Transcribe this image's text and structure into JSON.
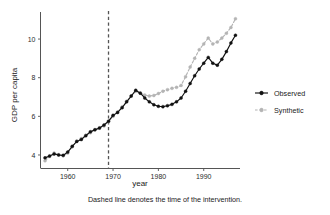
{
  "chart_data": {
    "type": "line",
    "title": "",
    "xlabel": "year",
    "ylabel": "GDP per capita",
    "xlim": [
      1954,
      1998
    ],
    "ylim": [
      3.3,
      11.4
    ],
    "xticks": [
      1960,
      1970,
      1980,
      1990
    ],
    "xtick_labels": [
      "1960",
      "1970",
      "1980",
      "1990"
    ],
    "yticks": [
      4,
      6,
      8,
      10
    ],
    "ytick_labels": [
      "4",
      "6",
      "8",
      "10"
    ],
    "grid": false,
    "legend_position": "right-outside",
    "caption": "Dashed line denotes the time of the intervention.",
    "annotations": [
      {
        "kind": "vline",
        "x": 1969,
        "style": "dashed",
        "color": "#555555",
        "label": "time of the intervention"
      }
    ],
    "x": [
      1955,
      1956,
      1957,
      1958,
      1959,
      1960,
      1961,
      1962,
      1963,
      1964,
      1965,
      1966,
      1967,
      1968,
      1969,
      1970,
      1971,
      1972,
      1973,
      1974,
      1975,
      1976,
      1977,
      1978,
      1979,
      1980,
      1981,
      1982,
      1983,
      1984,
      1985,
      1986,
      1987,
      1988,
      1989,
      1990,
      1991,
      1992,
      1993,
      1994,
      1995,
      1996,
      1997
    ],
    "series": [
      {
        "name": "Observed",
        "color": "#111111",
        "linestyle": "solid",
        "marker": "circle-filled",
        "values": [
          3.85,
          3.95,
          4.05,
          4.0,
          3.98,
          4.15,
          4.45,
          4.7,
          4.8,
          5.0,
          5.2,
          5.3,
          5.4,
          5.55,
          5.75,
          6.05,
          6.2,
          6.45,
          6.75,
          7.05,
          7.35,
          7.2,
          6.95,
          6.75,
          6.6,
          6.52,
          6.5,
          6.55,
          6.62,
          6.75,
          6.95,
          7.3,
          7.7,
          8.1,
          8.45,
          8.75,
          9.05,
          8.75,
          8.65,
          8.95,
          9.35,
          9.8,
          10.2
        ]
      },
      {
        "name": "Synthetic",
        "color": "#b4b4b4",
        "linestyle": "dashed",
        "marker": "circle",
        "values": [
          3.7,
          3.92,
          4.1,
          4.02,
          3.96,
          4.1,
          4.42,
          4.72,
          4.85,
          5.02,
          5.15,
          5.32,
          5.38,
          5.5,
          5.72,
          6.0,
          6.22,
          6.48,
          6.78,
          7.05,
          7.3,
          7.22,
          7.1,
          7.05,
          7.08,
          7.18,
          7.3,
          7.38,
          7.45,
          7.5,
          7.6,
          8.05,
          8.55,
          9.0,
          9.45,
          9.75,
          10.05,
          9.75,
          9.85,
          10.05,
          10.3,
          10.6,
          11.05
        ]
      }
    ]
  },
  "legend": {
    "items": [
      {
        "label": "Observed"
      },
      {
        "label": "Synthetic"
      }
    ]
  },
  "axes": {
    "x_title": "year",
    "y_title": "GDP per capita"
  },
  "caption": {
    "text": "Dashed line denotes the time of the intervention."
  }
}
